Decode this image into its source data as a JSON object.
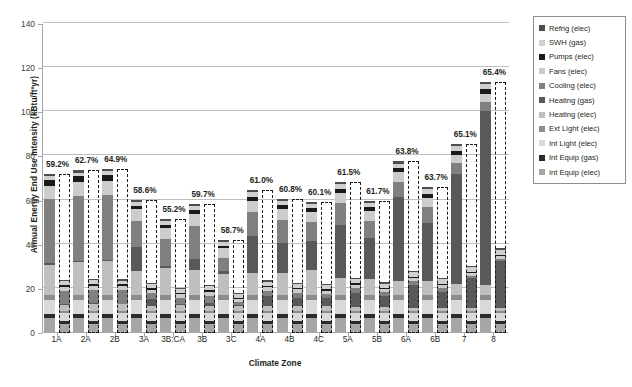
{
  "chart_data": {
    "type": "bar",
    "title": "",
    "xlabel": "Climate Zone",
    "ylabel": "Annual Energy End Use Intensity (kBtu/ft²yr)",
    "ylim": [
      0,
      140
    ],
    "yticks": [
      0,
      20,
      40,
      60,
      80,
      100,
      120,
      140
    ],
    "grid": true,
    "legend_position": "right",
    "stacked": true,
    "categories": [
      "1A",
      "2A",
      "2B",
      "3A",
      "3B:CA",
      "3B",
      "3C",
      "4A",
      "4B",
      "4C",
      "5A",
      "5B",
      "6A",
      "6B",
      "7",
      "8"
    ],
    "annotations": [
      "59.2%",
      "62.7%",
      "64.9%",
      "58.6%",
      "55.2%",
      "59.7%",
      "58.7%",
      "61.0%",
      "60.8%",
      "60.1%",
      "61.5%",
      "61.7%",
      "63.8%",
      "63.7%",
      "65.1%",
      "65.4%"
    ],
    "series_order": [
      "Int Equip (elec)",
      "Int Equip (gas)",
      "Int Light (elec)",
      "Ext Light (elec)",
      "Heating (elec)",
      "Heating (gas)",
      "Cooling (elec)",
      "Fans (elec)",
      "Pumps (elec)",
      "SWH (gas)",
      "Refrig (elec)"
    ],
    "series": [
      {
        "name": "Int Equip (elec)",
        "color": "#a6a6a6",
        "values": [
          6.8,
          6.8,
          6.8,
          6.8,
          6.8,
          6.8,
          6.8,
          6.8,
          6.8,
          6.8,
          6.8,
          6.8,
          6.8,
          6.8,
          6.8,
          6.8
        ],
        "values_proposed": [
          4.0,
          4.0,
          4.0,
          4.0,
          4.0,
          4.0,
          4.0,
          4.0,
          4.0,
          4.0,
          4.0,
          4.0,
          4.0,
          4.0,
          4.0,
          4.0
        ]
      },
      {
        "name": "Int Equip (gas)",
        "color": "#2b2b2b",
        "values": [
          1.6,
          1.6,
          1.6,
          1.6,
          1.6,
          1.6,
          1.6,
          1.6,
          1.6,
          1.6,
          1.6,
          1.6,
          1.6,
          1.6,
          1.6,
          1.6
        ],
        "values_proposed": [
          1.6,
          1.6,
          1.6,
          1.6,
          1.6,
          1.6,
          1.6,
          1.6,
          1.6,
          1.6,
          1.6,
          1.6,
          1.6,
          1.6,
          1.6,
          1.6
        ]
      },
      {
        "name": "Int Light (elec)",
        "color": "#d9d9d9",
        "values": [
          6.6,
          6.6,
          6.6,
          6.6,
          6.6,
          6.6,
          6.6,
          6.6,
          6.6,
          6.6,
          6.6,
          6.6,
          6.6,
          6.6,
          6.6,
          6.6
        ],
        "values_proposed": [
          3.3,
          3.3,
          3.3,
          3.3,
          3.3,
          3.3,
          3.3,
          3.3,
          3.3,
          3.3,
          3.3,
          3.3,
          3.3,
          3.3,
          3.3,
          3.3
        ]
      },
      {
        "name": "Ext Light (elec)",
        "color": "#8c8c8c",
        "values": [
          2.2,
          2.2,
          2.2,
          2.2,
          2.2,
          2.2,
          2.2,
          2.2,
          2.2,
          2.2,
          2.2,
          2.2,
          2.2,
          2.2,
          2.2,
          2.2
        ],
        "values_proposed": [
          1.1,
          1.1,
          1.1,
          1.1,
          1.1,
          1.1,
          1.1,
          1.1,
          1.1,
          1.1,
          1.1,
          1.1,
          1.1,
          1.1,
          1.1,
          1.1
        ]
      },
      {
        "name": "Heating (elec)",
        "color": "#bfbfbf",
        "values": [
          13.8,
          15.0,
          15.3,
          11.0,
          12.2,
          11.5,
          9.6,
          9.8,
          10.2,
          11.5,
          7.8,
          7.2,
          6.4,
          6.6,
          5.2,
          4.6
        ],
        "values_proposed": [
          2.8,
          3.0,
          3.0,
          2.4,
          2.6,
          2.4,
          2.2,
          2.2,
          2.2,
          2.4,
          1.8,
          1.6,
          1.5,
          1.5,
          1.2,
          1.2
        ]
      },
      {
        "name": "Heating (gas)",
        "color": "#595959",
        "values": [
          0.6,
          0.6,
          0.5,
          11.0,
          1.0,
          5.0,
          1.4,
          17.0,
          13.2,
          13.0,
          23.8,
          18.5,
          38.0,
          26.0,
          49.5,
          79.0
        ],
        "values_proposed": [
          0.4,
          0.4,
          0.3,
          3.0,
          0.5,
          1.4,
          0.5,
          4.6,
          3.6,
          3.4,
          6.4,
          5.0,
          10.4,
          7.2,
          13.6,
          21.5
        ]
      },
      {
        "name": "Cooling (elec)",
        "color": "#808080",
        "values": [
          29.0,
          29.5,
          29.6,
          11.8,
          12.2,
          14.8,
          6.0,
          11.0,
          10.8,
          8.4,
          10.2,
          8.0,
          7.0,
          7.2,
          5.0,
          4.0
        ],
        "values_proposed": [
          5.8,
          6.0,
          6.0,
          2.6,
          2.8,
          3.2,
          1.4,
          2.4,
          2.4,
          1.9,
          2.2,
          1.8,
          1.6,
          1.6,
          1.1,
          0.9
        ]
      },
      {
        "name": "Fans (elec)",
        "color": "#cccccc",
        "values": [
          6.2,
          6.2,
          6.4,
          5.0,
          5.2,
          5.6,
          4.4,
          5.0,
          5.0,
          4.8,
          4.6,
          4.4,
          4.2,
          4.4,
          3.8,
          3.6
        ],
        "values_proposed": [
          2.0,
          2.0,
          2.0,
          1.6,
          1.7,
          1.8,
          1.4,
          1.6,
          1.6,
          1.5,
          1.5,
          1.4,
          1.3,
          1.4,
          1.2,
          1.1
        ]
      },
      {
        "name": "Pumps (elec)",
        "color": "#1a1a1a",
        "values": [
          2.6,
          2.6,
          2.6,
          1.6,
          1.0,
          1.6,
          0.9,
          1.8,
          1.6,
          1.6,
          1.8,
          1.6,
          1.9,
          1.8,
          1.8,
          2.0
        ],
        "values_proposed": [
          0.9,
          0.9,
          0.9,
          0.6,
          0.4,
          0.6,
          0.4,
          0.6,
          0.6,
          0.6,
          0.6,
          0.6,
          0.7,
          0.6,
          0.6,
          0.7
        ]
      },
      {
        "name": "SWH (gas)",
        "color": "#d0d0d0",
        "values": [
          1.6,
          1.6,
          1.6,
          1.8,
          1.8,
          1.8,
          1.8,
          1.9,
          1.9,
          1.9,
          2.0,
          2.0,
          2.1,
          2.1,
          2.2,
          2.4
        ],
        "values_proposed": [
          1.6,
          1.6,
          1.6,
          1.8,
          1.8,
          1.8,
          1.8,
          1.9,
          1.9,
          1.9,
          2.0,
          2.0,
          2.1,
          2.1,
          2.2,
          2.4
        ]
      },
      {
        "name": "Refrig (elec)",
        "color": "#4d4d4d",
        "values": [
          1.0,
          1.0,
          1.0,
          1.0,
          1.0,
          1.0,
          1.0,
          1.0,
          1.0,
          1.0,
          1.0,
          1.0,
          1.0,
          1.0,
          1.0,
          1.0
        ],
        "values_proposed": [
          0.6,
          0.6,
          0.6,
          0.6,
          0.6,
          0.6,
          0.6,
          0.6,
          0.6,
          0.6,
          0.6,
          0.6,
          0.6,
          0.6,
          0.6,
          0.6
        ]
      }
    ],
    "baseline_totals": [
      72.0,
      72.9,
      73.2,
      59.4,
      45.0,
      57.5,
      40.1,
      63.9,
      54.7,
      58.4,
      66.4,
      58.7,
      88.0,
      66.3,
      86.7,
      113.8
    ],
    "proposed_outline_totals": [
      72.0,
      72.9,
      73.2,
      59.4,
      45.0,
      57.5,
      40.1,
      63.9,
      54.7,
      58.4,
      66.4,
      58.7,
      88.0,
      66.3,
      86.7,
      113.8
    ]
  },
  "legend": {
    "items": [
      {
        "label": "Refrig (elec)",
        "color": "#4d4d4d"
      },
      {
        "label": "SWH (gas)",
        "color": "#d0d0d0"
      },
      {
        "label": "Pumps (elec)",
        "color": "#1a1a1a"
      },
      {
        "label": "Fans (elec)",
        "color": "#cccccc"
      },
      {
        "label": "Cooling (elec)",
        "color": "#808080"
      },
      {
        "label": "Heating (gas)",
        "color": "#595959"
      },
      {
        "label": "Heating (elec)",
        "color": "#bfbfbf"
      },
      {
        "label": "Ext Light (elec)",
        "color": "#8c8c8c"
      },
      {
        "label": "Int Light (elec)",
        "color": "#d9d9d9"
      },
      {
        "label": "Int Equip (gas)",
        "color": "#2b2b2b"
      },
      {
        "label": "Int Equip (elec)",
        "color": "#a6a6a6"
      }
    ]
  }
}
